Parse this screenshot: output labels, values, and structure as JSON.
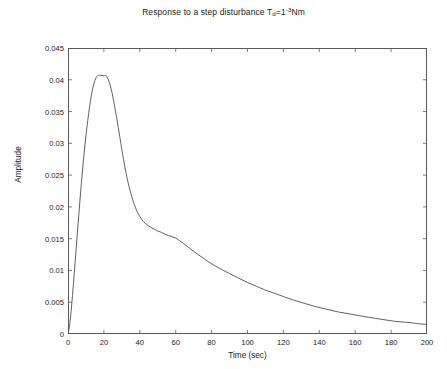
{
  "chart_data": {
    "type": "line",
    "title_parts": {
      "prefix": "Response to a step disturbance T",
      "subscript": "d",
      "middle": "=1",
      "superscript": "-3",
      "suffix": "Nm"
    },
    "xlabel": "Time (sec)",
    "ylabel": "Amplitude",
    "xlim": [
      0,
      200
    ],
    "ylim": [
      0,
      0.045
    ],
    "xticks": [
      0,
      20,
      40,
      60,
      80,
      100,
      120,
      140,
      160,
      180,
      200
    ],
    "xtick_labels": [
      "0",
      "20",
      "40",
      "60",
      "80",
      "100",
      "120",
      "140",
      "160",
      "180",
      "200"
    ],
    "yticks": [
      0,
      0.005,
      0.01,
      0.015,
      0.02,
      0.025,
      0.03,
      0.035,
      0.04,
      0.045
    ],
    "ytick_labels": [
      "0",
      "0.005",
      "0.01",
      "0.015",
      "0.02",
      "0.025",
      "0.03",
      "0.035",
      "0.04",
      "0.045"
    ],
    "grid": false,
    "legend": false,
    "line_color": "#4d4d4d",
    "axis_color": "#5a5a5a",
    "background": "#ffffff",
    "series": [
      {
        "name": "step disturbance response",
        "x": [
          0,
          1,
          2,
          3,
          4,
          5,
          6,
          7,
          8,
          9,
          10,
          11,
          12,
          13,
          14,
          15,
          16,
          17,
          18,
          19,
          20,
          21,
          22,
          23,
          24,
          25,
          26,
          27,
          28,
          29,
          30,
          32,
          34,
          36,
          38,
          40,
          42,
          44,
          46,
          48,
          50,
          52,
          54,
          56,
          58,
          60,
          63,
          66,
          70,
          74,
          78,
          82,
          86,
          90,
          95,
          100,
          105,
          110,
          115,
          120,
          126,
          132,
          138,
          144,
          150,
          156,
          162,
          168,
          175,
          182,
          190,
          196,
          200
        ],
        "y": [
          0.0,
          0.0016,
          0.0044,
          0.0078,
          0.0114,
          0.0151,
          0.0187,
          0.0222,
          0.0255,
          0.0285,
          0.0312,
          0.0336,
          0.0357,
          0.0375,
          0.0389,
          0.0399,
          0.0405,
          0.0407,
          0.0407,
          0.0407,
          0.0406,
          0.0407,
          0.0403,
          0.0396,
          0.0386,
          0.0373,
          0.0358,
          0.0342,
          0.0325,
          0.0308,
          0.029,
          0.0258,
          0.0232,
          0.0212,
          0.0196,
          0.0185,
          0.0177,
          0.0172,
          0.0168,
          0.0165,
          0.0162,
          0.016,
          0.0157,
          0.0155,
          0.0153,
          0.0151,
          0.0145,
          0.0139,
          0.013,
          0.0122,
          0.0114,
          0.0107,
          0.0101,
          0.0095,
          0.0088,
          0.0081,
          0.0075,
          0.0069,
          0.0064,
          0.0059,
          0.0053,
          0.0048,
          0.0043,
          0.0039,
          0.0035,
          0.0032,
          0.0029,
          0.0026,
          0.0023,
          0.002,
          0.0018,
          0.0016,
          0.0015
        ]
      }
    ]
  }
}
